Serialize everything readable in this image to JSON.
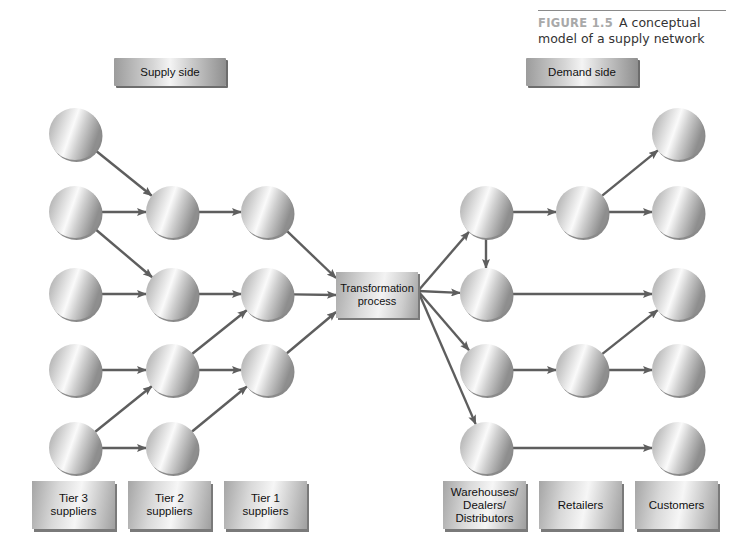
{
  "figure": {
    "number": "FIGURE 1.5",
    "title_line1": "A conceptual",
    "title_line2": "model of a supply network"
  },
  "header_labels": {
    "supply_side": "Supply side",
    "demand_side": "Demand side"
  },
  "center": {
    "label": "Transformation\nprocess"
  },
  "tiers": [
    {
      "id": "tier3",
      "label": "Tier 3\nsuppliers"
    },
    {
      "id": "tier2",
      "label": "Tier 2\nsuppliers"
    },
    {
      "id": "tier1",
      "label": "Tier 1\nsuppliers"
    },
    {
      "id": "wdd",
      "label": "Warehouses/\nDealers/\nDistributors"
    },
    {
      "id": "retailers",
      "label": "Retailers"
    },
    {
      "id": "customers",
      "label": "Customers"
    }
  ],
  "colors": {
    "arrow": "#5e5e5e",
    "node_light": "#f2f2f2",
    "node_dark": "#9a9a9a",
    "caption_number": "#a9a9a9"
  },
  "nodes": [
    {
      "id": "t3a",
      "col": "tier3",
      "x": 75,
      "y": 134
    },
    {
      "id": "t3b",
      "col": "tier3",
      "x": 75,
      "y": 212
    },
    {
      "id": "t3c",
      "col": "tier3",
      "x": 75,
      "y": 294
    },
    {
      "id": "t3d",
      "col": "tier3",
      "x": 75,
      "y": 370
    },
    {
      "id": "t3e",
      "col": "tier3",
      "x": 75,
      "y": 448
    },
    {
      "id": "t2a",
      "col": "tier2",
      "x": 172,
      "y": 212
    },
    {
      "id": "t2b",
      "col": "tier2",
      "x": 172,
      "y": 294
    },
    {
      "id": "t2c",
      "col": "tier2",
      "x": 172,
      "y": 370
    },
    {
      "id": "t2d",
      "col": "tier2",
      "x": 172,
      "y": 448
    },
    {
      "id": "t1a",
      "col": "tier1",
      "x": 267,
      "y": 212
    },
    {
      "id": "t1b",
      "col": "tier1",
      "x": 267,
      "y": 294
    },
    {
      "id": "t1c",
      "col": "tier1",
      "x": 267,
      "y": 370
    },
    {
      "id": "wa",
      "col": "wdd",
      "x": 486,
      "y": 212
    },
    {
      "id": "wb",
      "col": "wdd",
      "x": 486,
      "y": 294
    },
    {
      "id": "wc",
      "col": "wdd",
      "x": 486,
      "y": 370
    },
    {
      "id": "wd",
      "col": "wdd",
      "x": 486,
      "y": 448
    },
    {
      "id": "ra",
      "col": "retailers",
      "x": 582,
      "y": 212
    },
    {
      "id": "rb",
      "col": "retailers",
      "x": 582,
      "y": 370
    },
    {
      "id": "ca",
      "col": "customers",
      "x": 678,
      "y": 134
    },
    {
      "id": "cb",
      "col": "customers",
      "x": 678,
      "y": 212
    },
    {
      "id": "cc",
      "col": "customers",
      "x": 678,
      "y": 294
    },
    {
      "id": "cd",
      "col": "customers",
      "x": 678,
      "y": 370
    },
    {
      "id": "ce",
      "col": "customers",
      "x": 678,
      "y": 448
    }
  ],
  "edges": [
    [
      "t3a",
      "t2a"
    ],
    [
      "t3b",
      "t2a"
    ],
    [
      "t3b",
      "t2b"
    ],
    [
      "t3c",
      "t2b"
    ],
    [
      "t3d",
      "t2c"
    ],
    [
      "t3e",
      "t2c"
    ],
    [
      "t3e",
      "t2d"
    ],
    [
      "t2a",
      "t1a"
    ],
    [
      "t2b",
      "t1b"
    ],
    [
      "t2c",
      "t1b"
    ],
    [
      "t2c",
      "t1c"
    ],
    [
      "t2d",
      "t1c"
    ],
    [
      "t1a",
      "transform"
    ],
    [
      "t1b",
      "transform"
    ],
    [
      "t1c",
      "transform"
    ],
    [
      "transform",
      "wa"
    ],
    [
      "transform",
      "wb"
    ],
    [
      "transform",
      "wc"
    ],
    [
      "transform",
      "wd"
    ],
    [
      "wa",
      "wb"
    ],
    [
      "wa",
      "ra"
    ],
    [
      "wb",
      "cc"
    ],
    [
      "wc",
      "rb"
    ],
    [
      "wd",
      "ce"
    ],
    [
      "ra",
      "ca"
    ],
    [
      "ra",
      "cb"
    ],
    [
      "rb",
      "cc"
    ],
    [
      "rb",
      "cd"
    ]
  ]
}
